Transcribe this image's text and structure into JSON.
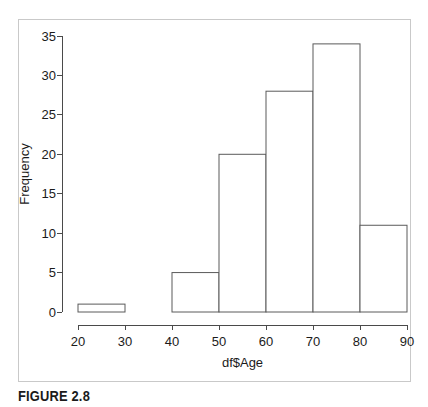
{
  "caption": "FIGURE 2.8",
  "chart_data": {
    "type": "bar",
    "title": "",
    "xlabel": "df$Age",
    "ylabel": "Frequency",
    "xlim": [
      20,
      90
    ],
    "ylim": [
      0,
      35
    ],
    "xticks": [
      "20",
      "30",
      "40",
      "50",
      "60",
      "70",
      "80",
      "90"
    ],
    "yticks": [
      "0",
      "5",
      "10",
      "15",
      "20",
      "25",
      "30",
      "35"
    ],
    "grid": false,
    "legend": false,
    "bin_edges": [
      20,
      30,
      40,
      50,
      60,
      70,
      80,
      90
    ],
    "categories": [
      "20-30",
      "30-40",
      "40-50",
      "50-60",
      "60-70",
      "70-80",
      "80-90"
    ],
    "values": [
      1,
      0,
      5,
      20,
      28,
      34,
      11
    ],
    "bar_fill": "#ffffff",
    "bar_stroke": "#5a5a5a",
    "axis_color": "#4a4a4a",
    "frame_color": "#c9c9c9"
  }
}
